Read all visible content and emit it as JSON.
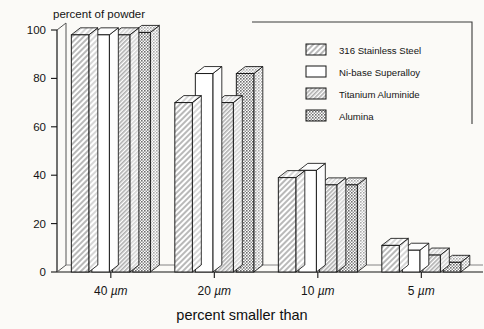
{
  "chart_data": {
    "type": "bar",
    "title": "",
    "xlabel": "percent smaller than",
    "ylabel": "percent of powder",
    "categories": [
      "40 µm",
      "20 µm",
      "10 µm",
      "5 µm"
    ],
    "ylim": [
      0,
      100
    ],
    "yticks": [
      0,
      20,
      40,
      60,
      80,
      100
    ],
    "ytick_labels": [
      "0",
      "20",
      "40",
      "60",
      "80",
      "100"
    ],
    "grid": false,
    "legend_position": "top-right",
    "style": "3d-grouped-bars",
    "series": [
      {
        "name": "316 Stainless Steel",
        "pattern": "diagonal-hatch",
        "color": "#d8d8d8",
        "values": [
          98,
          70,
          39,
          11
        ]
      },
      {
        "name": "Ni-base Superalloy",
        "pattern": "solid-white",
        "color": "#ffffff",
        "values": [
          98,
          82,
          42,
          9
        ]
      },
      {
        "name": "Titanium Aluminide",
        "pattern": "fine-hatch",
        "color": "#cfcfcf",
        "values": [
          98,
          70,
          36,
          7
        ]
      },
      {
        "name": "Alumina",
        "pattern": "dense-dot",
        "color": "#a9a9a9",
        "values": [
          99,
          82,
          36,
          4
        ]
      }
    ]
  },
  "axis": {
    "y_title": "percent of powder",
    "x_title": "percent smaller than",
    "y_ticks": [
      "100",
      "80",
      "60",
      "40",
      "20",
      "0"
    ],
    "x_categories": [
      "40 µm",
      "20 µm",
      "10 µm",
      "5 µm"
    ]
  },
  "legend": {
    "entries": [
      {
        "label": "316 Stainless Steel"
      },
      {
        "label": "Ni-base Superalloy"
      },
      {
        "label": "Titanium Aluminide"
      },
      {
        "label": "Alumina"
      }
    ]
  },
  "colors": {
    "background": "#fbfaf7",
    "ink": "#141414",
    "bar_steel": "#d8d8d8",
    "bar_nibase": "#ffffff",
    "bar_titanium": "#cfcfcf",
    "bar_alumina": "#a9a9a9"
  }
}
